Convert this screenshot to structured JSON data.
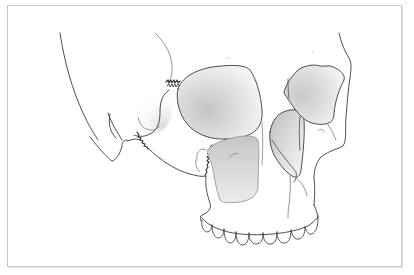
{
  "figure": {
    "colors": {
      "background": "#ffffff",
      "frame_border": "#c9c9c9",
      "outline": "#3a3a3a",
      "shade": "#d0d0d0",
      "fracture": "#2a2a2a"
    },
    "labels": [
      {
        "id": "orbit-label-left",
        "text": ""
      },
      {
        "id": "orbit-label-right",
        "text": ""
      }
    ],
    "elements": [
      "cranium-outline",
      "left-orbit",
      "right-orbit",
      "nasal-aperture-left",
      "nasal-aperture-right",
      "zygomatic-arch",
      "frontozygomatic-fracture",
      "infraorbital-fracture",
      "zygomaticomaxillary-fracture",
      "maxilla",
      "upper-teeth"
    ]
  }
}
